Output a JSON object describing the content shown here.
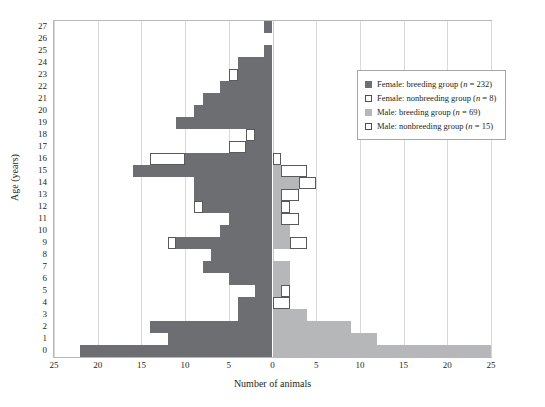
{
  "chart_data": {
    "type": "bar",
    "subtype": "population-pyramid",
    "title": "",
    "xlabel": "Number of animals",
    "ylabel": "Age (years)",
    "xlim": [
      -25,
      25
    ],
    "ylim": [
      0,
      27
    ],
    "grid": true,
    "x_tick_labels": [
      "25",
      "20",
      "15",
      "10",
      "5",
      "0",
      "5",
      "10",
      "15",
      "20",
      "25"
    ],
    "x_tick_values": [
      -25,
      -20,
      -15,
      -10,
      -5,
      0,
      5,
      10,
      15,
      20,
      25
    ],
    "categories": [
      27,
      26,
      25,
      24,
      23,
      22,
      21,
      20,
      19,
      18,
      17,
      16,
      15,
      14,
      13,
      12,
      11,
      10,
      9,
      8,
      7,
      6,
      5,
      4,
      3,
      2,
      1,
      0
    ],
    "legend_position": "right",
    "series": [
      {
        "name": "Female: breeding group",
        "n": 232,
        "side": "left",
        "color": "#6d6e71",
        "style": "filled",
        "values": [
          1,
          0,
          1,
          4,
          4,
          6,
          8,
          9,
          11,
          2,
          3,
          10,
          16,
          9,
          9,
          8,
          5,
          6,
          11,
          7,
          8,
          5,
          2,
          4,
          4,
          14,
          12,
          22
        ]
      },
      {
        "name": "Female: nonbreeding group",
        "n": 8,
        "side": "left",
        "color": "#ffffff",
        "style": "outline",
        "values": [
          0,
          0,
          0,
          0,
          1,
          0,
          0,
          0,
          0,
          1,
          2,
          4,
          0,
          0,
          0,
          1,
          0,
          0,
          1,
          0,
          0,
          0,
          0,
          0,
          0,
          0,
          0,
          0
        ]
      },
      {
        "name": "Male: breeding group",
        "n": 69,
        "side": "right",
        "color": "#b6b7b9",
        "style": "filled",
        "values": [
          0,
          0,
          0,
          0,
          0,
          0,
          0,
          0,
          0,
          0,
          0,
          0,
          1,
          3,
          1,
          1,
          1,
          2,
          2,
          0,
          2,
          2,
          1,
          0,
          4,
          9,
          12,
          25
        ]
      },
      {
        "name": "Male: nonbreeding group",
        "n": 15,
        "side": "right",
        "color": "#ffffff",
        "style": "outline",
        "values": [
          0,
          0,
          0,
          0,
          0,
          0,
          0,
          0,
          0,
          0,
          0,
          1,
          3,
          2,
          2,
          1,
          2,
          0,
          2,
          0,
          0,
          0,
          1,
          2,
          0,
          0,
          0,
          0
        ]
      }
    ]
  },
  "axes": {
    "x_title": "Number of animals",
    "y_title": "Age (years)"
  },
  "legend": {
    "items": [
      {
        "label": "Female: breeding group (n = 232)",
        "swatch": "fem-breed"
      },
      {
        "label": "Female: nonbreeding group (n = 8)",
        "swatch": "fem-nonbreed"
      },
      {
        "label": "Male: breeding group (n = 69)",
        "swatch": "male-breed"
      },
      {
        "label": "Male: nonbreeding group (n = 15)",
        "swatch": "male-nonbreed"
      }
    ]
  }
}
